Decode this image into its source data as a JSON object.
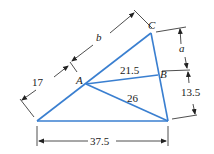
{
  "diagram": {
    "type": "triangle-dimension-figure",
    "colors": {
      "triangle": "#3a7fd0",
      "dimension": "#222222",
      "text": "#1a1a1a"
    },
    "vertices": {
      "A": "A",
      "B": "B",
      "C": "C"
    },
    "labels": {
      "seg_b": "b",
      "seg_17": "17",
      "seg_a": "a",
      "seg_13_5": "13.5",
      "seg_21_5": "21.5",
      "seg_26": "26",
      "base_37_5": "37.5"
    }
  }
}
